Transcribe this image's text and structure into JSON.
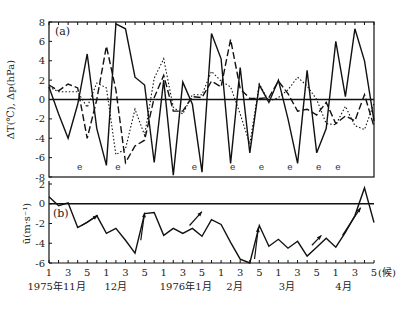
{
  "chart_data": [
    {
      "panel": "(a)",
      "type": "line",
      "ylabel": "ΔT(℃), Δp(hPa)",
      "ylim": [
        -8,
        8
      ],
      "yticks": [
        8,
        6,
        4,
        2,
        0,
        -2,
        -4,
        -6,
        -8
      ],
      "x_unit": "候",
      "x": [
        0,
        1,
        2,
        3,
        4,
        5,
        6,
        7,
        8,
        9,
        10,
        11,
        12,
        13,
        14,
        15,
        16,
        17,
        18,
        19,
        20,
        21,
        22,
        23,
        24,
        25,
        26,
        27,
        28,
        29,
        30,
        31,
        32,
        33,
        34
      ],
      "series": [
        {
          "name": "solid",
          "style": "solid",
          "values": [
            1.3,
            -1.5,
            -4.0,
            -0.5,
            4.7,
            -3.0,
            -6.8,
            7.8,
            7.3,
            2.3,
            1.5,
            -6.5,
            2.0,
            -7.8,
            1.8,
            -0.5,
            -7.5,
            6.8,
            4.2,
            -6.6,
            3.3,
            -5.5,
            1.5,
            -0.3,
            2.0,
            -2.0,
            -6.6,
            3.0,
            -5.5,
            -3.0,
            6.0,
            0.3,
            7.3,
            4.0,
            -2.2
          ]
        },
        {
          "name": "dashed",
          "style": "dashed",
          "values": [
            1.5,
            0.9,
            1.6,
            1.2,
            -4.0,
            0.0,
            5.5,
            1.0,
            -6.5,
            -4.8,
            -4.2,
            0.2,
            2.5,
            -1.2,
            -1.2,
            0.3,
            0.2,
            1.9,
            1.3,
            6.2,
            1.1,
            0.1,
            0.1,
            0.2,
            1.9,
            0.6,
            -1.2,
            -1.0,
            -1.6,
            -0.3,
            -2.5,
            -1.7,
            -2.2,
            0.5,
            -2.8
          ]
        },
        {
          "name": "dotted",
          "style": "dotted",
          "values": [
            1.3,
            0.8,
            0.8,
            0.8,
            -0.8,
            1.7,
            1.2,
            -5.7,
            -5.1,
            -1.0,
            -3.7,
            2.2,
            4.2,
            -0.8,
            -1.5,
            0.5,
            0.5,
            2.9,
            1.9,
            1.3,
            -1.5,
            -4.6,
            1.6,
            -0.2,
            0.2,
            1.0,
            2.3,
            1.4,
            0.0,
            -2.5,
            -2.6,
            -0.7,
            -2.7,
            -3.1,
            -0.4
          ]
        }
      ],
      "annotations": {
        "e_markers_x": [
          3,
          7,
          15,
          19,
          22,
          25,
          28,
          30
        ]
      }
    },
    {
      "panel": "(b)",
      "type": "line",
      "ylabel": "ū(m·s⁻¹)",
      "ylim": [
        -6,
        2
      ],
      "yticks": [
        2,
        0,
        -2,
        -4,
        -6
      ],
      "x": [
        0,
        1,
        2,
        3,
        4,
        5,
        6,
        7,
        8,
        9,
        10,
        11,
        12,
        13,
        14,
        15,
        16,
        17,
        18,
        19,
        20,
        21,
        22,
        23,
        24,
        25,
        26,
        27,
        28,
        29,
        30,
        31,
        32,
        33,
        34
      ],
      "series": [
        {
          "name": "u",
          "style": "solid",
          "values": [
            0.7,
            -0.2,
            0.1,
            -2.4,
            -1.9,
            -1.2,
            -3.0,
            -2.5,
            -3.7,
            -5.0,
            -1.0,
            -0.9,
            -3.2,
            -2.5,
            -3.0,
            -2.5,
            -3.3,
            -1.6,
            -2.1,
            -3.9,
            -5.6,
            -6.0,
            -2.2,
            -4.3,
            -3.6,
            -4.5,
            -3.8,
            -5.3,
            -4.4,
            -3.5,
            -4.4,
            -2.9,
            -1.2,
            1.6,
            -1.9,
            -3.6
          ]
        }
      ],
      "annotations": {
        "arrows_start_x": [
          3.6,
          9.6,
          14.6,
          21.5,
          27.5,
          30.5
        ]
      }
    }
  ],
  "axis": {
    "x_ticks": [
      "1",
      "3",
      "5",
      "1",
      "3",
      "5",
      "1",
      "3",
      "5",
      "1",
      "3",
      "5",
      "1",
      "3",
      "5",
      "1",
      "3",
      "5"
    ],
    "x_tick_unit": "(候)",
    "month_labels": [
      {
        "text": "1975年11月",
        "at": 1.0
      },
      {
        "text": "12月",
        "at": 7.2
      },
      {
        "text": "1976年1月",
        "at": 14.5
      },
      {
        "text": "2月",
        "at": 19.6
      },
      {
        "text": "3月",
        "at": 25.1
      },
      {
        "text": "4月",
        "at": 31.0
      }
    ]
  },
  "labels": {
    "panel_a": "(a)",
    "panel_b": "(b)",
    "ylabel_a": "ΔT(℃), Δp(hPa)",
    "ylabel_b": "ū(m·s⁻¹)",
    "e": "e"
  }
}
